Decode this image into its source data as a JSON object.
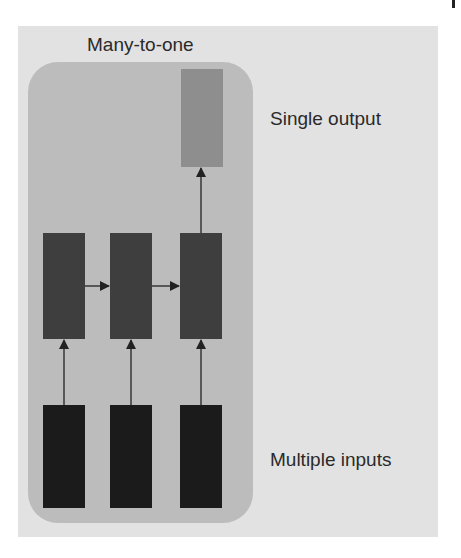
{
  "diagram": {
    "title": "Many-to-one",
    "labels": {
      "output": "Single output",
      "inputs": "Multiple inputs"
    },
    "nodes": {
      "output": [
        {
          "id": "y",
          "role": "output"
        }
      ],
      "hidden": [
        {
          "id": "h1",
          "role": "hidden"
        },
        {
          "id": "h2",
          "role": "hidden"
        },
        {
          "id": "h3",
          "role": "hidden"
        }
      ],
      "inputs": [
        {
          "id": "x1",
          "role": "input"
        },
        {
          "id": "x2",
          "role": "input"
        },
        {
          "id": "x3",
          "role": "input"
        }
      ]
    },
    "edges": [
      {
        "from": "x1",
        "to": "h1"
      },
      {
        "from": "x2",
        "to": "h2"
      },
      {
        "from": "x3",
        "to": "h3"
      },
      {
        "from": "h1",
        "to": "h2"
      },
      {
        "from": "h2",
        "to": "h3"
      },
      {
        "from": "h3",
        "to": "y"
      }
    ],
    "colors": {
      "panel_background": "#e2e2e2",
      "group_box": "#bcbcbc",
      "output_node": "#8e8e8e",
      "hidden_node": "#3e3e3e",
      "input_node": "#1b1b1b",
      "arrow": "#222222",
      "text": "#2a2a2a"
    }
  }
}
